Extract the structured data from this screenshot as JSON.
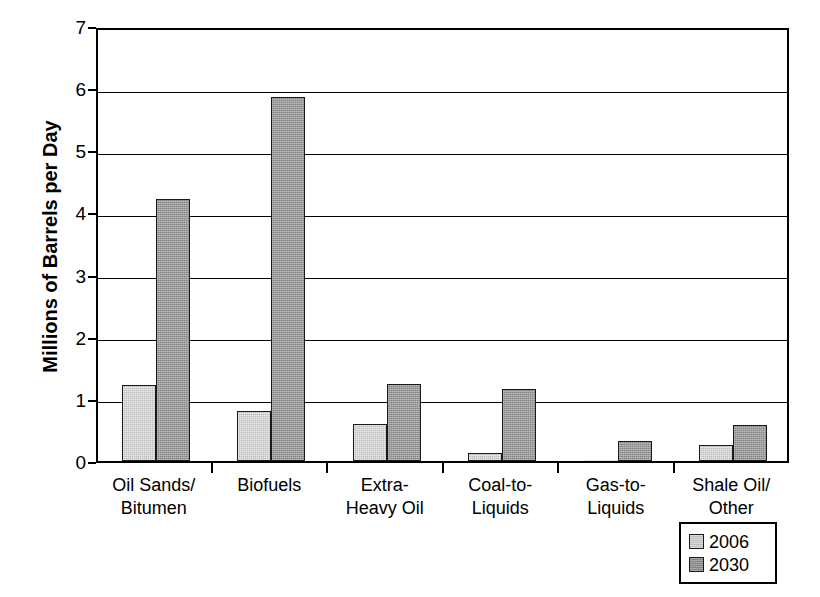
{
  "chart_data": {
    "type": "bar",
    "title": "",
    "subtitle": "",
    "xlabel": "",
    "ylabel": "Millions of Barrels per Day",
    "ylim": [
      0,
      7
    ],
    "ytick_values": [
      7,
      6,
      5,
      4,
      3,
      2,
      1,
      0
    ],
    "ytick_labels": [
      "7",
      "6",
      "5",
      "4",
      "3",
      "2",
      "1",
      "0"
    ],
    "grid": true,
    "grid_axis": "y",
    "legend_position": "bottom-right",
    "categories": [
      "Oil Sands/\nBitumen",
      "Biofuels",
      "Extra-\nHeavy Oil",
      "Coal-to-\nLiquids",
      "Gas-to-\nLiquids",
      "Shale Oil/\nOther"
    ],
    "series": [
      {
        "name": "2006",
        "color": "#bdbdbd",
        "values": [
          1.23,
          0.8,
          0.6,
          0.13,
          0.01,
          0.25
        ]
      },
      {
        "name": "2030",
        "color": "#858585",
        "values": [
          4.22,
          5.85,
          1.24,
          1.16,
          0.33,
          0.58
        ]
      }
    ]
  },
  "legend": {
    "entries": [
      {
        "label": "2006"
      },
      {
        "label": "2030"
      }
    ]
  },
  "colors": {
    "series_2006": "#bdbdbd",
    "series_2030": "#858585",
    "axis": "#000000",
    "background": "#ffffff"
  }
}
